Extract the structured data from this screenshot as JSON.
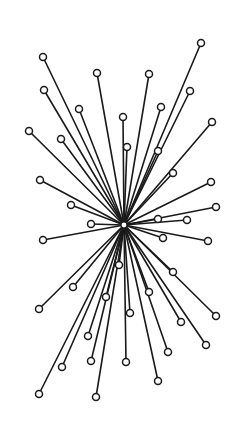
{
  "diagram": {
    "type": "star-graph",
    "background": "#ffffff",
    "line_color": "#1a1a1a",
    "node_fill": "#ffffff",
    "hub": {
      "x": 124,
      "y": 225,
      "r": 3
    },
    "leaf_radius": 3.5,
    "leaves": [
      {
        "x": 201,
        "y": 43
      },
      {
        "x": 43,
        "y": 57
      },
      {
        "x": 97,
        "y": 73
      },
      {
        "x": 149,
        "y": 74
      },
      {
        "x": 44,
        "y": 90
      },
      {
        "x": 190,
        "y": 91
      },
      {
        "x": 161,
        "y": 107
      },
      {
        "x": 79,
        "y": 109
      },
      {
        "x": 123,
        "y": 117
      },
      {
        "x": 212,
        "y": 122
      },
      {
        "x": 29,
        "y": 131
      },
      {
        "x": 61,
        "y": 139
      },
      {
        "x": 127,
        "y": 147
      },
      {
        "x": 158,
        "y": 151
      },
      {
        "x": 173,
        "y": 173
      },
      {
        "x": 40,
        "y": 180
      },
      {
        "x": 211,
        "y": 182
      },
      {
        "x": 71,
        "y": 205
      },
      {
        "x": 216,
        "y": 207
      },
      {
        "x": 158,
        "y": 219
      },
      {
        "x": 187,
        "y": 220
      },
      {
        "x": 91,
        "y": 224
      },
      {
        "x": 163,
        "y": 238
      },
      {
        "x": 43,
        "y": 240
      },
      {
        "x": 208,
        "y": 241
      },
      {
        "x": 119,
        "y": 265
      },
      {
        "x": 173,
        "y": 272
      },
      {
        "x": 73,
        "y": 287
      },
      {
        "x": 149,
        "y": 292
      },
      {
        "x": 106,
        "y": 297
      },
      {
        "x": 39,
        "y": 309
      },
      {
        "x": 130,
        "y": 313
      },
      {
        "x": 216,
        "y": 316
      },
      {
        "x": 181,
        "y": 322
      },
      {
        "x": 88,
        "y": 336
      },
      {
        "x": 206,
        "y": 345
      },
      {
        "x": 168,
        "y": 352
      },
      {
        "x": 91,
        "y": 361
      },
      {
        "x": 126,
        "y": 362
      },
      {
        "x": 62,
        "y": 367
      },
      {
        "x": 158,
        "y": 381
      },
      {
        "x": 39,
        "y": 394
      },
      {
        "x": 96,
        "y": 397
      }
    ]
  }
}
